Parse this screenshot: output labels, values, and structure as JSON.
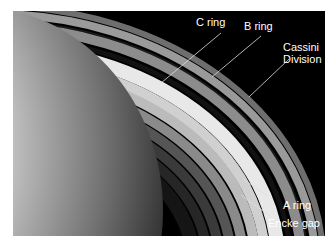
{
  "figure": {
    "background_color": "#000000",
    "label_color": "#ffffff",
    "labels": [
      {
        "id": "c-ring",
        "text": "C ring"
      },
      {
        "id": "b-ring",
        "text": "B ring"
      },
      {
        "id": "cassini-division",
        "text": "Cassini\nDivision",
        "lines": [
          "Cassini",
          "Division"
        ]
      },
      {
        "id": "a-ring",
        "text": "A ring"
      },
      {
        "id": "encke-gap",
        "text": "Encke gap"
      }
    ]
  }
}
